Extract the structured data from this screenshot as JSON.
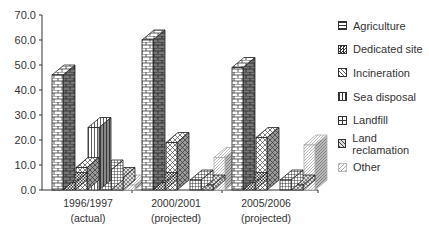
{
  "chart_data": {
    "type": "bar",
    "subtype": "3d-clustered",
    "title": "",
    "xlabel": "",
    "ylabel": "",
    "ylim": [
      0,
      70
    ],
    "yticks": [
      "0.0",
      "10.0",
      "20.0",
      "30.0",
      "40.0",
      "50.0",
      "60.0",
      "70.0"
    ],
    "grid": false,
    "legend_position": "right",
    "categories": [
      "1996/1997 (actual)",
      "2000/2001 (projected)",
      "2005/2006 (projected)"
    ],
    "category_lines": [
      [
        "1996/1997",
        "(actual)"
      ],
      [
        "2000/2001",
        "(projected)"
      ],
      [
        "2005/2006",
        "(projected)"
      ]
    ],
    "series": [
      {
        "name": "Agriculture",
        "values": [
          46,
          60,
          49
        ],
        "pattern": "brick"
      },
      {
        "name": "Dedicated site",
        "values": [
          3,
          3,
          3
        ],
        "pattern": "checker"
      },
      {
        "name": "Incineration",
        "values": [
          9,
          19,
          21
        ],
        "pattern": "diamond"
      },
      {
        "name": "Sea disposal",
        "values": [
          25,
          0,
          0
        ],
        "pattern": "vstripe"
      },
      {
        "name": "Landfill",
        "values": [
          8,
          4,
          4
        ],
        "pattern": "grid"
      },
      {
        "name": "Land reclamation",
        "values": [
          5,
          2,
          2
        ],
        "pattern": "weave"
      },
      {
        "name": "Other",
        "values": [
          2,
          13,
          18
        ],
        "pattern": "diag"
      }
    ]
  }
}
